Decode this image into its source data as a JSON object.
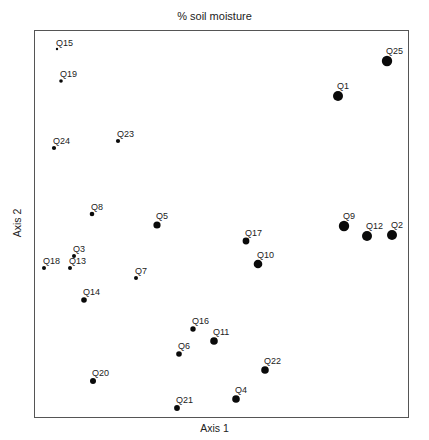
{
  "chart_data": {
    "type": "scatter",
    "title": "% soil moisture",
    "xlabel": "Axis 1",
    "ylabel": "Axis 2",
    "grid": false,
    "legend": null,
    "frame": {
      "left": 34,
      "top": 30,
      "right": 408,
      "bottom": 417
    },
    "encoding": "point size proportional to % soil moisture",
    "points": [
      {
        "label": "Q15",
        "x": 57,
        "y": 49,
        "size": 1.2
      },
      {
        "label": "Q19",
        "x": 61,
        "y": 81,
        "size": 1.8
      },
      {
        "label": "Q24",
        "x": 54,
        "y": 148,
        "size": 2.1
      },
      {
        "label": "Q23",
        "x": 118,
        "y": 141,
        "size": 2.1
      },
      {
        "label": "Q8",
        "x": 92,
        "y": 214,
        "size": 2.3
      },
      {
        "label": "Q5",
        "x": 157,
        "y": 225,
        "size": 3.6
      },
      {
        "label": "Q3",
        "x": 74,
        "y": 256,
        "size": 2.0
      },
      {
        "label": "Q18",
        "x": 44,
        "y": 268,
        "size": 2.0
      },
      {
        "label": "Q13",
        "x": 70,
        "y": 268,
        "size": 2.0
      },
      {
        "label": "Q7",
        "x": 136,
        "y": 278,
        "size": 2.0
      },
      {
        "label": "Q14",
        "x": 84,
        "y": 300,
        "size": 2.8
      },
      {
        "label": "Q17",
        "x": 246,
        "y": 241,
        "size": 3.4
      },
      {
        "label": "Q10",
        "x": 258,
        "y": 264,
        "size": 4.3
      },
      {
        "label": "Q9",
        "x": 344,
        "y": 226,
        "size": 5.2
      },
      {
        "label": "Q12",
        "x": 367,
        "y": 236,
        "size": 5.0
      },
      {
        "label": "Q2",
        "x": 392,
        "y": 235,
        "size": 5.0
      },
      {
        "label": "Q25",
        "x": 387,
        "y": 61,
        "size": 5.2
      },
      {
        "label": "Q1",
        "x": 338,
        "y": 96,
        "size": 5.0
      },
      {
        "label": "Q16",
        "x": 193,
        "y": 329,
        "size": 2.7
      },
      {
        "label": "Q11",
        "x": 214,
        "y": 341,
        "size": 3.8
      },
      {
        "label": "Q6",
        "x": 179,
        "y": 354,
        "size": 2.8
      },
      {
        "label": "Q22",
        "x": 265,
        "y": 370,
        "size": 3.8
      },
      {
        "label": "Q20",
        "x": 93,
        "y": 381,
        "size": 3.0
      },
      {
        "label": "Q4",
        "x": 236,
        "y": 399,
        "size": 3.8
      },
      {
        "label": "Q21",
        "x": 177,
        "y": 408,
        "size": 2.9
      }
    ]
  },
  "colors": {
    "point": "#0a0a0a",
    "frame": "#555555",
    "text": "#222222",
    "background": "#ffffff"
  }
}
